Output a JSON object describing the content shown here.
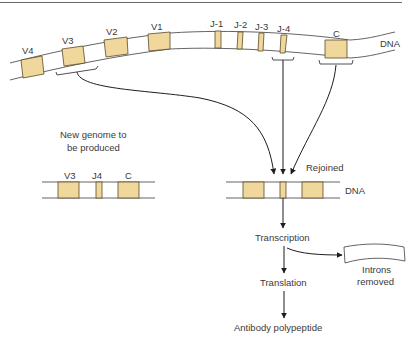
{
  "diagram": {
    "colors": {
      "segment_fill": "#f0d79c",
      "segment_stroke": "#5a4a2a",
      "line": "#3c3c3c",
      "arrow": "#1e1e1e",
      "top_rule": "#555555"
    },
    "germline_dna": {
      "label": "DNA",
      "segments": [
        {
          "id": "v4",
          "label": "V4"
        },
        {
          "id": "v3",
          "label": "V3"
        },
        {
          "id": "v2",
          "label": "V2"
        },
        {
          "id": "v1",
          "label": "V1"
        },
        {
          "id": "j1",
          "label": "J-1"
        },
        {
          "id": "j2",
          "label": "J-2"
        },
        {
          "id": "j3",
          "label": "J-3"
        },
        {
          "id": "j4",
          "label": "J-4"
        },
        {
          "id": "c",
          "label": "C"
        }
      ]
    },
    "new_genome": {
      "caption_line1": "New genome to",
      "caption_line2": "be produced",
      "segments": [
        {
          "id": "v3",
          "label": "V3"
        },
        {
          "id": "j4",
          "label": "J4"
        },
        {
          "id": "c",
          "label": "C"
        }
      ]
    },
    "rejoined_dna": {
      "label_rejoined": "Rejoined",
      "label_dna": "DNA"
    },
    "flow": {
      "step1": "Transcription",
      "step2": "Translation",
      "step3": "Antibody polypeptide",
      "side_line1": "Introns",
      "side_line2": "removed"
    }
  }
}
